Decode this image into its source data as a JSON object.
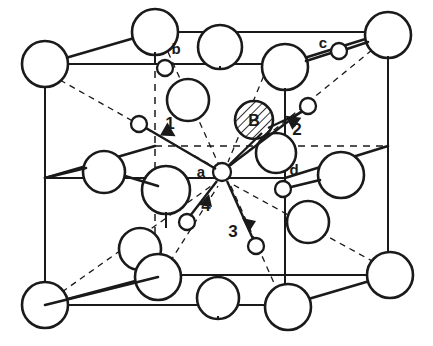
{
  "figure": {
    "type": "crystal-unit-cell-diagram",
    "background_color": "#ffffff",
    "line_color": "#1a1a1a"
  },
  "site_labels": [
    {
      "id": "a",
      "text": "a",
      "x": 201,
      "y": 177
    },
    {
      "id": "b",
      "text": "b",
      "x": 176,
      "y": 54
    },
    {
      "id": "c",
      "text": "c",
      "x": 323,
      "y": 48
    },
    {
      "id": "d",
      "text": "d",
      "x": 294,
      "y": 175
    }
  ],
  "atom_labels": [
    {
      "id": "B",
      "text": "B",
      "x": 254,
      "y": 124
    }
  ],
  "direction_labels": [
    {
      "id": "1",
      "text": "1",
      "x": 170,
      "y": 129
    },
    {
      "id": "2",
      "text": "2",
      "x": 297,
      "y": 135
    },
    {
      "id": "3",
      "text": "3",
      "x": 233,
      "y": 237
    },
    {
      "id": "4",
      "text": "4",
      "x": 206,
      "y": 211
    }
  ],
  "large_atoms": [
    {
      "name": "corner-top-back-left",
      "cx": 45,
      "cy": 64,
      "r": 23
    },
    {
      "name": "corner-top-front-left",
      "cx": 155,
      "cy": 32,
      "r": 23
    },
    {
      "name": "corner-top-back-right",
      "cx": 388,
      "cy": 35,
      "r": 23
    },
    {
      "name": "corner-top-front-right",
      "cx": 285,
      "cy": 67,
      "r": 23
    },
    {
      "name": "face-top-mid",
      "cx": 220,
      "cy": 47,
      "r": 22
    },
    {
      "name": "interior-upper-left",
      "cx": 188,
      "cy": 100,
      "r": 21
    },
    {
      "name": "edge-left-mid",
      "cx": 104,
      "cy": 172,
      "r": 21
    },
    {
      "name": "face-center-left",
      "cx": 166,
      "cy": 190,
      "r": 24
    },
    {
      "name": "edge-right-mid",
      "cx": 341,
      "cy": 175,
      "r": 23
    },
    {
      "name": "interior-right-upper",
      "cx": 276,
      "cy": 153,
      "r": 20
    },
    {
      "name": "interior-right-lower",
      "cx": 308,
      "cy": 222,
      "r": 21
    },
    {
      "name": "interior-lower-left",
      "cx": 140,
      "cy": 249,
      "r": 21
    },
    {
      "name": "corner-bottom-back-left",
      "cx": 45,
      "cy": 305,
      "r": 23
    },
    {
      "name": "corner-bottom-front-left",
      "cx": 158,
      "cy": 277,
      "r": 23
    },
    {
      "name": "corner-bottom-front-right",
      "cx": 288,
      "cy": 307,
      "r": 23
    },
    {
      "name": "corner-bottom-back-right",
      "cx": 390,
      "cy": 275,
      "r": 23
    },
    {
      "name": "face-bottom-mid",
      "cx": 218,
      "cy": 298,
      "r": 21
    }
  ],
  "small_atoms": [
    {
      "name": "site-b-atom",
      "cx": 165,
      "cy": 68,
      "r": 8
    },
    {
      "name": "site-c-atom",
      "cx": 339,
      "cy": 51,
      "r": 8
    },
    {
      "name": "site-d-atom",
      "cx": 283,
      "cy": 189,
      "r": 8
    },
    {
      "name": "site-a-center-atom",
      "cx": 222,
      "cy": 172,
      "r": 9
    },
    {
      "name": "target-atom-1",
      "cx": 139,
      "cy": 124,
      "r": 8
    },
    {
      "name": "target-atom-2",
      "cx": 308,
      "cy": 106,
      "r": 8
    },
    {
      "name": "target-atom-3",
      "cx": 256,
      "cy": 246,
      "r": 8
    },
    {
      "name": "target-atom-4",
      "cx": 187,
      "cy": 222,
      "r": 8
    }
  ],
  "hatched_atoms": [
    {
      "name": "b-interstitial-atom",
      "cx": 254,
      "cy": 120,
      "r": 19
    }
  ],
  "jump_vectors": [
    {
      "id": "1",
      "from_x": 139,
      "from_y": 124,
      "to_x": 218,
      "to_y": 170,
      "label": "1"
    },
    {
      "id": "2",
      "from_x": 308,
      "from_y": 106,
      "to_x": 227,
      "to_y": 167,
      "label": "2"
    },
    {
      "id": "3",
      "from_x": 256,
      "from_y": 246,
      "to_x": 226,
      "to_y": 180,
      "label": "3"
    },
    {
      "id": "4",
      "from_x": 187,
      "from_y": 222,
      "to_x": 218,
      "to_y": 180,
      "label": "4"
    }
  ],
  "cell_geometry": {
    "front_face": {
      "tl_x": 45,
      "tl_y": 64,
      "tr_x": 285,
      "tr_y": 64,
      "br_x": 285,
      "br_y": 305,
      "bl_x": 45,
      "bl_y": 305
    },
    "back_face": {
      "tl_x": 155,
      "tl_y": 32,
      "tr_x": 388,
      "tr_y": 32,
      "br_x": 388,
      "br_y": 275,
      "bl_x": 155,
      "bl_y": 275
    },
    "mid_plane_y": 178
  }
}
